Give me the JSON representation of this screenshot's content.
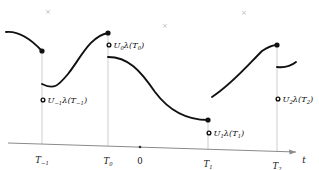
{
  "figure": {
    "kind": "piecewise-right-continuous-path-diagram",
    "background": "#ffffff",
    "ink_color": "#111111",
    "gridline_color": "#c9c9c9",
    "axis_color": "#8a8a8a",
    "artifact_color": "#b9b9b9"
  },
  "axis": {
    "name": "time-axis",
    "label": "t",
    "origin_label": "0",
    "origin_x": 140,
    "left_x": 8,
    "right_x": 297,
    "left_y": 143,
    "right_y": 152,
    "arrow": true,
    "ticks": [
      {
        "id": "t-minus-1",
        "label": "T",
        "subscript": "−1",
        "x": 42,
        "y": 144.0
      },
      {
        "id": "t-0",
        "label": "T",
        "subscript": "0",
        "x": 108,
        "y": 146.1
      },
      {
        "id": "t-1",
        "label": "T",
        "subscript": "1",
        "x": 208,
        "y": 149.2
      },
      {
        "id": "t-2",
        "label": "T",
        "subscript": "2",
        "x": 277,
        "y": 151.3
      }
    ]
  },
  "value_labels": [
    {
      "id": "u-minus-1",
      "text": "U",
      "subscript": "−1",
      "after": "λ(T",
      "after_sub": "−1",
      "tail": ")",
      "marker": "open-circle",
      "marker_x": 43,
      "marker_y": 100,
      "text_x": 48,
      "text_y": 103
    },
    {
      "id": "u-0",
      "text": "U",
      "subscript": "0",
      "after": "λ(T",
      "after_sub": "0",
      "tail": ")",
      "marker": "open-circle",
      "marker_x": 109,
      "marker_y": 45,
      "text_x": 114,
      "text_y": 48
    },
    {
      "id": "u-1",
      "text": "U",
      "subscript": "1",
      "after": "λ(T",
      "after_sub": "1",
      "tail": ")",
      "marker": "open-circle",
      "marker_x": 209,
      "marker_y": 133,
      "text_x": 214,
      "text_y": 136
    },
    {
      "id": "u-2",
      "text": "U",
      "subscript": "2",
      "after": "λ(T",
      "after_sub": "2",
      "tail": ")",
      "marker": "open-circle",
      "marker_x": 278,
      "marker_y": 99,
      "text_x": 283,
      "text_y": 102
    }
  ],
  "segments": [
    {
      "id": "segment-before-t-minus-1",
      "path": "M 6,32 C 16,31 28,36 42,51",
      "end_dot": {
        "x": 42,
        "y": 51
      }
    },
    {
      "id": "segment-t-minus-1-to-t-0",
      "path": "M 42,84 C 54,90 58,86 68,74 C 80,59 90,36 108,33",
      "end_dot": {
        "x": 108,
        "y": 33
      }
    },
    {
      "id": "segment-t-0-to-t-1",
      "path": "M 108,57 C 128,57 140,70 155,92 C 170,112 188,120 208,120",
      "end_dot": {
        "x": 208,
        "y": 120
      }
    },
    {
      "id": "segment-t-1-to-t-2",
      "path": "M 212,97 C 232,84 248,65 262,51 C 268,47 272,45 277,45",
      "end_dot": {
        "x": 277,
        "y": 45
      }
    },
    {
      "id": "segment-after-t-2",
      "path": "M 277,67 C 285,68 291,66 296,62",
      "end_dot": null
    }
  ],
  "vertical_drops": [
    {
      "id": "drop-t-minus-1",
      "x": 42,
      "y_top": 51,
      "y_bottom": 144
    },
    {
      "id": "drop-t-0",
      "x": 108,
      "y_top": 33,
      "y_bottom": 146
    },
    {
      "id": "drop-t-1",
      "x": 208,
      "y_top": 120,
      "y_bottom": 149
    },
    {
      "id": "drop-t-2",
      "x": 277,
      "y_top": 45,
      "y_bottom": 151
    }
  ],
  "scan_artifacts": [
    {
      "id": "artifact-1",
      "glyph": "×",
      "x": 48,
      "y": 14
    },
    {
      "id": "artifact-2",
      "glyph": "×",
      "x": 165,
      "y": 28
    },
    {
      "id": "artifact-3",
      "glyph": "×",
      "x": 244,
      "y": 15
    }
  ]
}
